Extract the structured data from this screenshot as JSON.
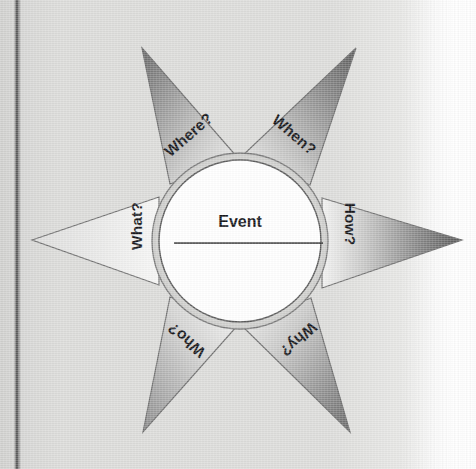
{
  "diagram": {
    "center": {
      "label": "Event",
      "has_underline": true
    },
    "rays": [
      {
        "id": "where",
        "label": "Where?",
        "position": "upper-left",
        "tip_shade": "#6d6d6d"
      },
      {
        "id": "when",
        "label": "When?",
        "position": "upper-right",
        "tip_shade": "#5f5f5f"
      },
      {
        "id": "how",
        "label": "How?",
        "position": "right",
        "tip_shade": "#5a5a5a"
      },
      {
        "id": "why",
        "label": "Why?",
        "position": "lower-right",
        "tip_shade": "#6b6b6b"
      },
      {
        "id": "who",
        "label": "Who?",
        "position": "lower-left",
        "tip_shade": "#8e8e8e"
      },
      {
        "id": "what",
        "label": "What?",
        "position": "left",
        "tip_shade": "#dcdcdc"
      }
    ]
  },
  "colors": {
    "paper": "#dbdbd9",
    "paper_highlight": "#ffffff",
    "spine_line": "#4a4a4a",
    "ink": "#15161a",
    "outline": "#6b6b6b",
    "ring_fill": "#d0d0ce"
  }
}
